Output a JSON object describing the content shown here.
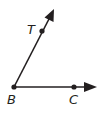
{
  "diagram": {
    "points": [
      {
        "id": "B",
        "label": "B",
        "x": 14,
        "y": 87,
        "role": "vertex"
      },
      {
        "id": "T",
        "label": "T",
        "x": 42,
        "y": 30,
        "role": "point-on-ray"
      },
      {
        "id": "C",
        "label": "C",
        "x": 74,
        "y": 87,
        "role": "point-on-ray"
      }
    ],
    "rays": [
      {
        "from": "B",
        "through": "T",
        "end_x": 54,
        "end_y": 10
      },
      {
        "from": "B",
        "through": "C",
        "end_x": 96,
        "end_y": 87
      }
    ],
    "labels": {
      "T": "T",
      "B": "B",
      "C": "C"
    },
    "colors": {
      "stroke": "#231f20",
      "background": "#ffffff"
    }
  }
}
